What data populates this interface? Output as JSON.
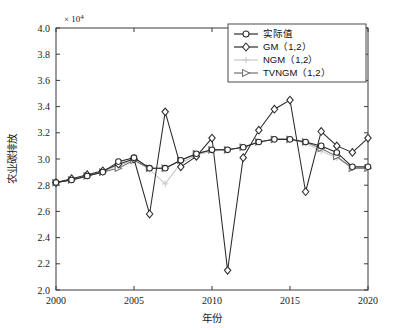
{
  "chart_data": {
    "type": "line",
    "title": "",
    "xlabel": "年份",
    "ylabel": "农业碳排放",
    "y_exponent_label": "× 10",
    "y_exponent_sup": "4",
    "xlim": [
      2000,
      2020
    ],
    "ylim": [
      2.0,
      4.0
    ],
    "xticks": [
      "2000",
      "2005",
      "2010",
      "2015",
      "2020"
    ],
    "yticks": [
      "2.0",
      "2.2",
      "2.4",
      "2.6",
      "2.8",
      "3.0",
      "3.2",
      "3.4",
      "3.6",
      "3.8",
      "4.0"
    ],
    "grid": false,
    "legend_position": "top-right",
    "x": [
      2000,
      2001,
      2002,
      2003,
      2004,
      2005,
      2006,
      2007,
      2008,
      2009,
      2010,
      2011,
      2012,
      2013,
      2014,
      2015,
      2016,
      2017,
      2018,
      2019,
      2020
    ],
    "series": [
      {
        "name": "实际值",
        "color": "#2b2b2b",
        "marker": "circle",
        "values": [
          2.82,
          2.84,
          2.87,
          2.9,
          2.98,
          3.01,
          2.93,
          2.93,
          2.99,
          3.04,
          3.07,
          3.07,
          3.09,
          3.13,
          3.15,
          3.15,
          3.13,
          3.1,
          3.05,
          2.94,
          2.94
        ]
      },
      {
        "name": "GM（1,2）",
        "color": "#2b2b2b",
        "marker": "diamond",
        "values": [
          2.82,
          2.85,
          2.88,
          2.91,
          2.96,
          3.0,
          2.58,
          3.36,
          2.94,
          3.02,
          3.16,
          2.15,
          3.01,
          3.22,
          3.38,
          3.45,
          2.75,
          3.21,
          3.1,
          3.05,
          3.16
        ]
      },
      {
        "name": "NGM（1,2）",
        "color": "#c8c8c8",
        "marker": "plus",
        "values": [
          2.82,
          2.84,
          2.87,
          2.9,
          2.95,
          2.99,
          2.92,
          2.81,
          2.97,
          3.03,
          3.06,
          3.07,
          3.09,
          3.13,
          3.15,
          3.15,
          3.12,
          3.06,
          3.01,
          2.93,
          2.93
        ]
      },
      {
        "name": "TVNGM（1,2）",
        "color": "#707070",
        "marker": "triangle-right",
        "values": [
          2.82,
          2.84,
          2.87,
          2.9,
          2.93,
          2.99,
          2.93,
          2.93,
          2.99,
          3.04,
          3.07,
          3.07,
          3.09,
          3.13,
          3.15,
          3.15,
          3.13,
          3.08,
          3.02,
          2.93,
          2.93
        ]
      }
    ]
  }
}
